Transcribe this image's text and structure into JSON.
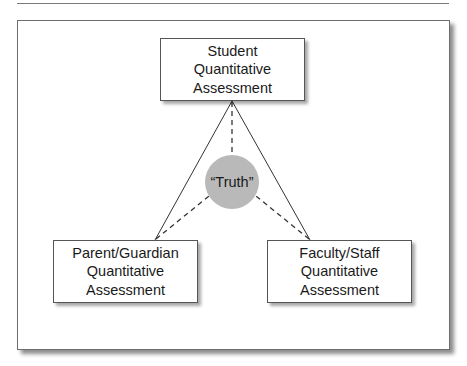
{
  "diagram": {
    "nodes": {
      "top": {
        "lines": [
          "Student",
          "Quantitative",
          "Assessment"
        ]
      },
      "bottom_left": {
        "lines": [
          "Parent/Guardian",
          "Quantitative",
          "Assessment"
        ]
      },
      "bottom_right": {
        "lines": [
          "Faculty/Staff",
          "Quantitative",
          "Assessment"
        ]
      },
      "center": {
        "label": "“Truth”"
      }
    },
    "edges": [
      {
        "from": "top",
        "to": "bottom_left",
        "style": "solid"
      },
      {
        "from": "top",
        "to": "bottom_right",
        "style": "solid"
      },
      {
        "from": "top",
        "to": "center",
        "style": "dashed"
      },
      {
        "from": "bottom_left",
        "to": "center",
        "style": "dashed"
      },
      {
        "from": "bottom_right",
        "to": "center",
        "style": "dashed"
      }
    ],
    "colors": {
      "circle_fill": "#b9b9b9",
      "line": "#333333",
      "frame": "#6e6e6e"
    }
  }
}
